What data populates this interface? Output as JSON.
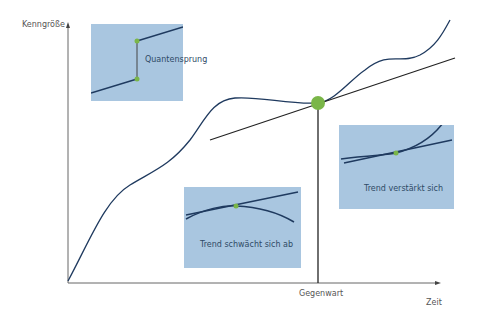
{
  "diagram": {
    "y_axis_label": "Kenngröße",
    "x_axis_label": "Zeit",
    "present_marker_label": "Gegenwart",
    "colors": {
      "curve": "#1f3a5f",
      "axis": "#555555",
      "box_fill": "#a9c6e0",
      "highlight_point": "#7ab648"
    },
    "insets": [
      {
        "id": "quantum-leap",
        "label": "Quantensprung"
      },
      {
        "id": "trend-weakens",
        "label": "Trend schwächt sich ab"
      },
      {
        "id": "trend-strengthens",
        "label": "Trend verstärkt sich"
      }
    ]
  }
}
